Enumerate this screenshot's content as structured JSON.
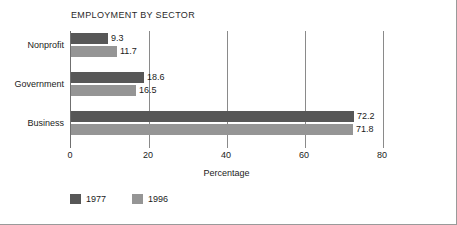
{
  "chart_data": {
    "type": "bar",
    "orientation": "horizontal",
    "title": "EMPLOYMENT BY SECTOR",
    "xlabel": "Percentage",
    "ylabel": "",
    "categories": [
      "Nonprofit",
      "Government",
      "Business"
    ],
    "series": [
      {
        "name": "1977",
        "color": "#575757",
        "values": [
          9.3,
          18.6,
          72.2
        ]
      },
      {
        "name": "1996",
        "color": "#959595",
        "values": [
          11.7,
          16.5,
          71.8
        ]
      }
    ],
    "value_labels": [
      [
        "9.3",
        "11.7"
      ],
      [
        "18.6",
        "16.5"
      ],
      [
        "72.2",
        "71.8"
      ]
    ],
    "xticks": [
      0,
      20,
      40,
      60,
      80
    ],
    "xtick_labels": [
      "0",
      "20",
      "40",
      "60",
      "80"
    ],
    "xlim": [
      0,
      80
    ],
    "grid": true,
    "grid_axis": "x",
    "legend": {
      "position": "bottom-left",
      "entries": [
        {
          "label": "1977",
          "color": "#575757"
        },
        {
          "label": "1996",
          "color": "#959595"
        }
      ]
    }
  }
}
